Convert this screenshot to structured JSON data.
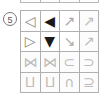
{
  "panel": {
    "row_index_label": "5",
    "colors": {
      "grid_line": "#b0b0b0",
      "glyph_solid": "#1a1a1a",
      "glyph_open": "#8a8a8a",
      "glyph_faint": "#bdbdbd",
      "background": "#ffffff"
    }
  },
  "top_partial_row": {
    "cells": [
      "",
      "",
      "",
      ""
    ]
  },
  "symbol_grid": {
    "columns": 4,
    "rows": 4,
    "cells": [
      {
        "icon": "triangle-left-outline",
        "glyph": "◁",
        "style": "open",
        "row": 1,
        "col": 1
      },
      {
        "icon": "triangle-left-filled",
        "glyph": "◀",
        "style": "solid",
        "row": 1,
        "col": 2
      },
      {
        "icon": "arrow-up-right-thin",
        "glyph": "↗",
        "style": "mid",
        "row": 1,
        "col": 3
      },
      {
        "icon": "arrow-up-right-thin-alt",
        "glyph": "↗",
        "style": "faint",
        "row": 1,
        "col": 4
      },
      {
        "icon": "triangle-right-outline",
        "glyph": "▷",
        "style": "open",
        "row": 2,
        "col": 1
      },
      {
        "icon": "triangle-down-filled",
        "glyph": "▼",
        "style": "solid",
        "row": 2,
        "col": 2
      },
      {
        "icon": "arrow-down-left-thin",
        "glyph": "↘",
        "style": "mid",
        "row": 2,
        "col": 3
      },
      {
        "icon": "arrow-up-right-thin-alt2",
        "glyph": "↗",
        "style": "faint",
        "row": 2,
        "col": 4
      },
      {
        "icon": "bowtie-x-symbol",
        "glyph": "⋈",
        "style": "faint",
        "row": 3,
        "col": 1
      },
      {
        "icon": "bowtie-x-symbol-alt",
        "glyph": "⋈",
        "style": "faint",
        "row": 3,
        "col": 2
      },
      {
        "icon": "subset-symbol",
        "glyph": "⊂",
        "style": "faint",
        "row": 3,
        "col": 3
      },
      {
        "icon": "superset-symbol",
        "glyph": "⊃",
        "style": "faint",
        "row": 3,
        "col": 4
      },
      {
        "icon": "cross-x-right-symbol",
        "glyph": "⨿",
        "style": "faint",
        "row": 4,
        "col": 1
      },
      {
        "icon": "cross-x-left-symbol",
        "glyph": "⨿",
        "style": "faint",
        "row": 4,
        "col": 2
      },
      {
        "icon": "intersection-symbol",
        "glyph": "∩",
        "style": "faint",
        "row": 4,
        "col": 3
      },
      {
        "icon": "superset-or-equal-symbol",
        "glyph": "⊇",
        "style": "faint",
        "row": 4,
        "col": 4
      }
    ]
  }
}
